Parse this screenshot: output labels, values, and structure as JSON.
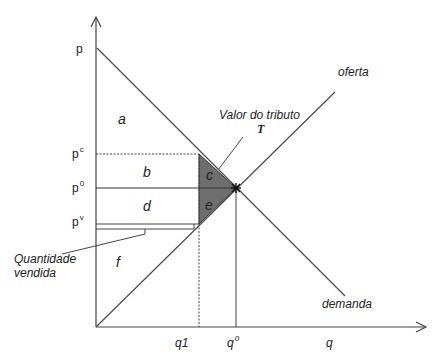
{
  "diagram": {
    "type": "supply-demand-tax",
    "axes": {
      "y_label": "p",
      "x_label": "q"
    },
    "curves": {
      "supply": "oferta",
      "demand": "demanda"
    },
    "price_labels": {
      "p": "p",
      "pc": {
        "base": "p",
        "sup": "c"
      },
      "p0": {
        "base": "p",
        "sup": "0"
      },
      "pv": {
        "base": "p",
        "sup": "v"
      }
    },
    "quantity_labels": {
      "q1": "q1",
      "q0": {
        "base": "q",
        "sup": "0"
      },
      "q": "q"
    },
    "areas": [
      "a",
      "b",
      "c",
      "d",
      "e",
      "f"
    ],
    "annotations": {
      "tax_value": "Valor do tributo",
      "tax_symbol": "T",
      "quantity_sold_line1": "Quantidade",
      "quantity_sold_line2": "vendida"
    },
    "colors": {
      "line": "#333333",
      "deadweight_fill": "#6e6e6e",
      "background": "#ffffff"
    }
  }
}
